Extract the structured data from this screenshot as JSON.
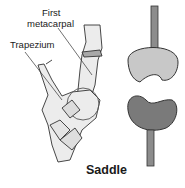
{
  "figure": {
    "labels": {
      "first_line1": "First",
      "first_line2": "metacarpal",
      "trapezium": "Trapezium"
    },
    "caption": "Saddle",
    "components": [
      "hand-bone-illustration",
      "saddle-joint-model-upper",
      "saddle-joint-model-lower"
    ],
    "colors": {
      "bone_fill": "#ececec",
      "outline": "#333333",
      "upper_saddle": "#c8c8c8",
      "lower_saddle": "#7a7a7a",
      "rod": "#8c8c8c"
    }
  }
}
